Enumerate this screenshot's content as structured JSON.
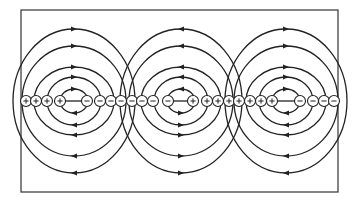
{
  "diagram": {
    "title": "",
    "frame": {
      "x": 21,
      "y": 10,
      "width": 317,
      "height": 182,
      "stroke": "#333333"
    },
    "axis_y": 101,
    "line_color": "#222222",
    "charge_radius": 5.5,
    "charges": [
      {
        "x": 26,
        "sign": "+"
      },
      {
        "x": 36,
        "sign": "+"
      },
      {
        "x": 47,
        "sign": "+"
      },
      {
        "x": 60,
        "sign": "+"
      },
      {
        "x": 87,
        "sign": "-"
      },
      {
        "x": 100,
        "sign": "-"
      },
      {
        "x": 111,
        "sign": "-"
      },
      {
        "x": 121,
        "sign": "-"
      },
      {
        "x": 132,
        "sign": "-"
      },
      {
        "x": 142,
        "sign": "-"
      },
      {
        "x": 153,
        "sign": "-"
      },
      {
        "x": 168,
        "sign": "-"
      },
      {
        "x": 193,
        "sign": "+"
      },
      {
        "x": 207,
        "sign": "+"
      },
      {
        "x": 218,
        "sign": "+"
      },
      {
        "x": 229,
        "sign": "+"
      },
      {
        "x": 239,
        "sign": "+"
      },
      {
        "x": 250,
        "sign": "+"
      },
      {
        "x": 261,
        "sign": "+"
      },
      {
        "x": 272,
        "sign": "+"
      },
      {
        "x": 300,
        "sign": "-"
      },
      {
        "x": 313,
        "sign": "-"
      },
      {
        "x": 324,
        "sign": "-"
      },
      {
        "x": 334,
        "sign": "-"
      }
    ],
    "groups": [
      {
        "name": "left-dipole",
        "cx": 74,
        "inner_from": 60,
        "inner_to": 87,
        "direction": "right",
        "loops": [
          {
            "rx": 14,
            "ry": 12
          },
          {
            "rx": 27,
            "ry": 24
          },
          {
            "rx": 40,
            "ry": 34
          },
          {
            "rx": 52,
            "ry": 55
          },
          {
            "rx": 61,
            "ry": 72
          }
        ]
      },
      {
        "name": "center-dipole",
        "cx": 181,
        "inner_from": 168,
        "inner_to": 193,
        "direction": "left",
        "loops": [
          {
            "rx": 14,
            "ry": 12
          },
          {
            "rx": 27,
            "ry": 24
          },
          {
            "rx": 40,
            "ry": 34
          },
          {
            "rx": 52,
            "ry": 55
          },
          {
            "rx": 61,
            "ry": 72
          }
        ]
      },
      {
        "name": "right-dipole",
        "cx": 286,
        "inner_from": 272,
        "inner_to": 300,
        "direction": "right",
        "loops": [
          {
            "rx": 14,
            "ry": 12
          },
          {
            "rx": 27,
            "ry": 24
          },
          {
            "rx": 40,
            "ry": 34
          },
          {
            "rx": 52,
            "ry": 55
          },
          {
            "rx": 61,
            "ry": 72
          }
        ]
      }
    ],
    "labels": {
      "positive": "+",
      "negative": "-"
    }
  }
}
